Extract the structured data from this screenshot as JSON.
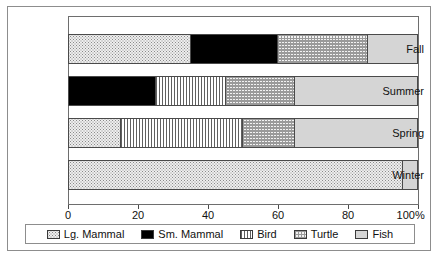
{
  "chart_data": {
    "type": "bar",
    "orientation": "horizontal",
    "stacked": "100%",
    "title": "",
    "xlabel": "",
    "ylabel": "",
    "xlim": [
      0,
      100
    ],
    "grid": false,
    "legend_position": "bottom",
    "categories": [
      "Fall",
      "Summer",
      "Spring",
      "Winter"
    ],
    "tick_labels": [
      "0",
      "20",
      "40",
      "60",
      "80",
      "100%"
    ],
    "tick_values": [
      0,
      20,
      40,
      60,
      80,
      100
    ],
    "series": [
      {
        "name": "Lg. Mammal",
        "pattern": "dotted-light",
        "values": [
          35,
          0,
          15,
          96
        ]
      },
      {
        "name": "Sm. Mammal",
        "pattern": "solid-black",
        "values": [
          25,
          25,
          0,
          0
        ]
      },
      {
        "name": "Bird",
        "pattern": "vertical-lines",
        "values": [
          0,
          20,
          35,
          0
        ]
      },
      {
        "name": "Turtle",
        "pattern": "checkered",
        "values": [
          26,
          20,
          15,
          0
        ]
      },
      {
        "name": "Fish",
        "pattern": "light-gray",
        "values": [
          14,
          35,
          35,
          4
        ]
      }
    ]
  },
  "legend": {
    "items": [
      {
        "label": "Lg. Mammal",
        "swatch": "swatch-lg-mammal"
      },
      {
        "label": "Sm. Mammal",
        "swatch": "swatch-sm-mammal"
      },
      {
        "label": "Bird",
        "swatch": "swatch-bird"
      },
      {
        "label": "Turtle",
        "swatch": "swatch-turtle"
      },
      {
        "label": "Fish",
        "swatch": "swatch-fish"
      }
    ]
  },
  "colors": {
    "frame": "#8d8d8d",
    "axis": "#4a4a4a",
    "text": "#111111",
    "sm_mammal": "#000000",
    "fish": "#d5d5d5",
    "lg_mammal": "#eeeeee"
  }
}
